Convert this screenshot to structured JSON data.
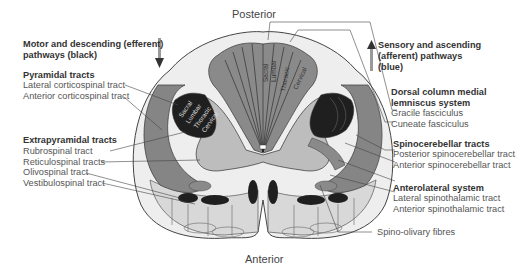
{
  "orientation": {
    "top": "Posterior",
    "bottom": "Anterior"
  },
  "left_panel": {
    "heading": "Motor and descending (efferent) pathways (black)",
    "heading_lines": [
      "Motor and descending (efferent)",
      "pathways (black)"
    ],
    "arrow_direction": "down",
    "groups": [
      {
        "title": "Pyramidal tracts",
        "items": [
          "Lateral corticospinal tract",
          "Anterior corticospinal tract"
        ]
      },
      {
        "title": "Extrapyramidal tracts",
        "items": [
          "Rubrospinal tract",
          "Reticulospinal tracts",
          "Olivospinal tract",
          "Vestibulospinal tract"
        ]
      }
    ]
  },
  "right_panel": {
    "heading": "Sensory and ascending (afferent) pathways (blue)",
    "heading_lines": [
      "Sensory and ascending",
      "(afferent) pathways",
      "(blue)"
    ],
    "arrow_direction": "up",
    "groups": [
      {
        "title": "Dorsal column medial lemniscus system",
        "title_lines": [
          "Dorsal column medial",
          "lemniscus system"
        ],
        "items": [
          "Gracile fasciculus",
          "Cuneate fasciculus"
        ]
      },
      {
        "title": "Spinocerebellar tracts",
        "items": [
          "Posterior spinocerebellar tract",
          "Anterior spinocerebellar tract"
        ]
      },
      {
        "title": "Anterolateral system",
        "items": [
          "Lateral spinothalamic tract",
          "Anterior spinothalamic tract"
        ]
      }
    ],
    "extra_items": [
      "Spino-olivary fibres"
    ]
  },
  "segment_labels": {
    "dorsal_column": [
      "Sacral",
      "Lumbar",
      "Thoracic",
      "Cervical"
    ],
    "lateral_corticospinal": [
      "Sacral",
      "Lumbar",
      "Thoracic",
      "Cervical"
    ],
    "spinothalamic": [
      "Cervical",
      "Thoracic",
      "Lumbar"
    ]
  },
  "colors": {
    "white_matter_dark": "#808080",
    "white_matter_light": "#c8c8c8",
    "grey_matter": "#bcbcbc",
    "black_tract": "#1e1e1e",
    "outline": "#555555"
  }
}
